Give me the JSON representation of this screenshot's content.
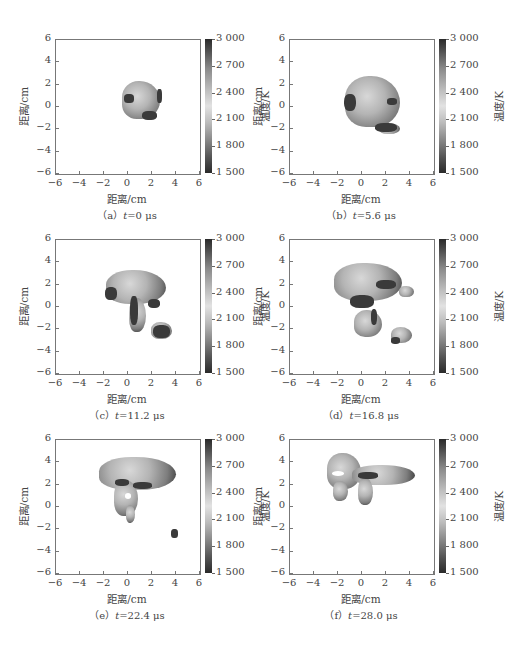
{
  "figure": {
    "bottom_caption_partial": ""
  },
  "axes_common": {
    "xlabel": "距离/cm",
    "ylabel": "距离/cm",
    "xticks": [
      "−6",
      "−4",
      "−2",
      "0",
      "2",
      "4",
      "6"
    ],
    "yticks": [
      "6",
      "4",
      "2",
      "0",
      "−2",
      "−4",
      "−6"
    ],
    "colorbar_label": "温度/K",
    "colorbar_ticks": [
      "3 000",
      "2 700",
      "2 400",
      "2 100",
      "1 800",
      "1 500"
    ]
  },
  "panels": [
    {
      "id": "a",
      "prefix": "（a）",
      "t_var": "t",
      "t_value": "=0 μs"
    },
    {
      "id": "b",
      "prefix": "（b）",
      "t_var": "t",
      "t_value": "=5.6 μs"
    },
    {
      "id": "c",
      "prefix": "（c）",
      "t_var": "t",
      "t_value": "=11.2 μs"
    },
    {
      "id": "d",
      "prefix": "（d）",
      "t_var": "t",
      "t_value": "=16.8 μs"
    },
    {
      "id": "e",
      "prefix": "（e）",
      "t_var": "t",
      "t_value": "=22.4 μs"
    },
    {
      "id": "f",
      "prefix": "（f）",
      "t_var": "t",
      "t_value": "=28.0 μs"
    }
  ],
  "chart_data": [
    {
      "type": "heatmap",
      "title": "(a) t=0 μs",
      "xlabel": "距离/cm",
      "ylabel": "距离/cm",
      "xlim": [
        -6,
        6
      ],
      "ylim": [
        -6,
        6
      ],
      "colorbar": {
        "label": "温度/K",
        "range": [
          1500,
          3000
        ],
        "ticks": [
          1500,
          1800,
          2100,
          2400,
          2700,
          3000
        ],
        "colormap": "grayscale (dark at both ends, light near 2 400)"
      },
      "region_extent": {
        "x": [
          -0.5,
          2.8
        ],
        "y": [
          -1.3,
          2.5
        ]
      }
    },
    {
      "type": "heatmap",
      "title": "(b) t=5.6 μs",
      "xlabel": "距离/cm",
      "ylabel": "距离/cm",
      "xlim": [
        -6,
        6
      ],
      "ylim": [
        -6,
        6
      ],
      "colorbar": {
        "label": "温度/K",
        "range": [
          1500,
          3000
        ],
        "ticks": [
          1500,
          1800,
          2100,
          2400,
          2700,
          3000
        ]
      },
      "region_extent": {
        "x": [
          -1.5,
          3.5
        ],
        "y": [
          -2.4,
          2.9
        ]
      }
    },
    {
      "type": "heatmap",
      "title": "(c) t=11.2 μs",
      "xlabel": "距离/cm",
      "ylabel": "距离/cm",
      "xlim": [
        -6,
        6
      ],
      "ylim": [
        -6,
        6
      ],
      "colorbar": {
        "label": "温度/K",
        "range": [
          1500,
          3000
        ],
        "ticks": [
          1500,
          1800,
          2100,
          2400,
          2700,
          3000
        ]
      },
      "region_extent": {
        "x": [
          -2.0,
          4.0
        ],
        "y": [
          -3.0,
          3.4
        ]
      }
    },
    {
      "type": "heatmap",
      "title": "(d) t=16.8 μs",
      "xlabel": "距离/cm",
      "ylabel": "距离/cm",
      "xlim": [
        -6,
        6
      ],
      "ylim": [
        -6,
        6
      ],
      "colorbar": {
        "label": "温度/K",
        "range": [
          1500,
          3000
        ],
        "ticks": [
          1500,
          1800,
          2100,
          2400,
          2700,
          3000
        ]
      },
      "region_extent": {
        "x": [
          -2.3,
          4.4
        ],
        "y": [
          -3.4,
          4.0
        ]
      }
    },
    {
      "type": "heatmap",
      "title": "(e) t=22.4 μs",
      "xlabel": "距离/cm",
      "ylabel": "距离/cm",
      "xlim": [
        -6,
        6
      ],
      "ylim": [
        -6,
        6
      ],
      "colorbar": {
        "label": "温度/K",
        "range": [
          1500,
          3000
        ],
        "ticks": [
          1500,
          1800,
          2100,
          2400,
          2700,
          3000
        ]
      },
      "region_extent": {
        "x": [
          -2.6,
          4.6
        ],
        "y": [
          -3.6,
          4.6
        ]
      }
    },
    {
      "type": "heatmap",
      "title": "(f) t=28.0 μs",
      "xlabel": "距离/cm",
      "ylabel": "距离/cm",
      "xlim": [
        -6,
        6
      ],
      "ylim": [
        -6,
        6
      ],
      "colorbar": {
        "label": "温度/K",
        "range": [
          1500,
          3000
        ],
        "ticks": [
          1500,
          1800,
          2100,
          2400,
          2700,
          3000
        ]
      },
      "region_extent": {
        "x": [
          -3.0,
          4.6
        ],
        "y": [
          -0.8,
          5.0
        ]
      }
    }
  ]
}
